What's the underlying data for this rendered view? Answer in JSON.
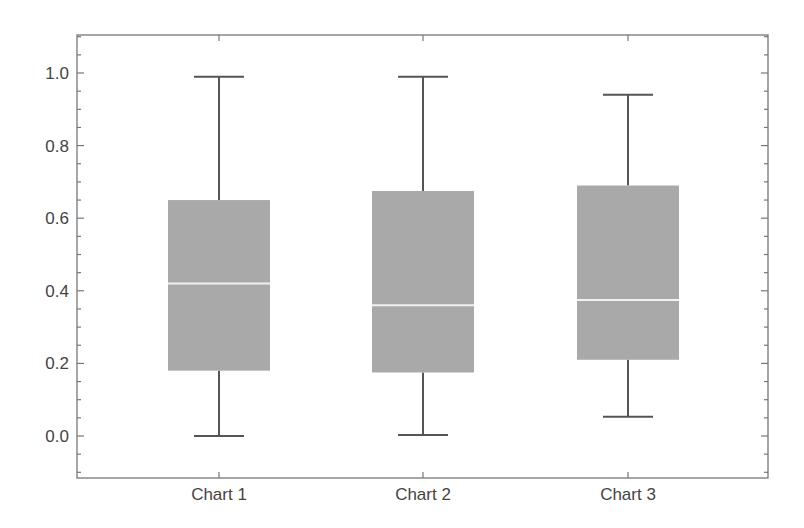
{
  "chart_data": {
    "type": "boxplot",
    "title": "",
    "xlabel": "",
    "ylabel": "",
    "categories": [
      "Chart 1",
      "Chart 2",
      "Chart 3"
    ],
    "ylim": [
      -0.1,
      1.1
    ],
    "yticks": [
      0.0,
      0.2,
      0.4,
      0.6,
      0.8,
      1.0
    ],
    "ytick_labels": [
      "0.0",
      "0.2",
      "0.4",
      "0.6",
      "0.8",
      "1.0"
    ],
    "grid": false,
    "legend": null,
    "series": [
      {
        "name": "Chart 1",
        "min": 0.0,
        "q1": 0.18,
        "median": 0.42,
        "q3": 0.65,
        "max": 0.99
      },
      {
        "name": "Chart 2",
        "min": 0.003,
        "q1": 0.175,
        "median": 0.36,
        "q3": 0.675,
        "max": 0.99
      },
      {
        "name": "Chart 3",
        "min": 0.053,
        "q1": 0.21,
        "median": 0.375,
        "q3": 0.69,
        "max": 0.94
      }
    ],
    "colors": {
      "box_fill": "#a9a9a9",
      "median_line": "#f2f2f2",
      "whisker": "#555555",
      "frame": "#777777",
      "text": "#444444"
    }
  }
}
